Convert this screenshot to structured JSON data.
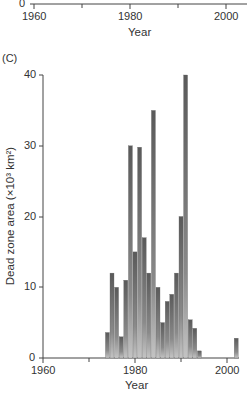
{
  "chart_data": [
    {
      "panel": "top (partial, cropped)",
      "type": "bar",
      "title": "",
      "xlabel": "Year",
      "ylabel": "",
      "x_ticks": [
        1960,
        1980,
        2000
      ],
      "y_ticks_visible": [
        0
      ],
      "xlim": [
        1960,
        2002
      ],
      "grid": false
    },
    {
      "panel": "(C)",
      "type": "bar",
      "title": "",
      "xlabel": "Year",
      "ylabel": "Dead zone area (×10³ km²)",
      "xlim": [
        1960,
        2003
      ],
      "ylim": [
        0,
        40
      ],
      "x_ticks": [
        1960,
        1980,
        2000
      ],
      "y_ticks": [
        0,
        10,
        20,
        30,
        40
      ],
      "grid": false,
      "legend": null,
      "categories": [
        1974,
        1975,
        1976,
        1977,
        1978,
        1979,
        1980,
        1981,
        1982,
        1983,
        1984,
        1985,
        1986,
        1987,
        1988,
        1989,
        1990,
        1991,
        1992,
        1993,
        1994,
        2002
      ],
      "values": [
        3.6,
        12,
        10,
        3,
        11,
        30,
        15,
        29.8,
        17,
        12,
        35,
        10,
        5,
        8,
        9,
        12,
        20,
        40,
        5.4,
        4.2,
        1,
        2.8
      ]
    }
  ],
  "top_panel": {
    "y_zero_label": "0",
    "x_labels": [
      "1960",
      "1980",
      "2000"
    ],
    "x_title": "Year"
  },
  "panel_c": {
    "panel_label": "(C)",
    "y_labels": [
      "40",
      "30",
      "20",
      "10",
      "0"
    ],
    "x_labels": [
      "1960",
      "1980",
      "2000"
    ],
    "x_title": "Year",
    "y_title": "Dead zone area (×10³ km²)"
  },
  "colors": {
    "axis": "#444444",
    "bar_dark": "#555555",
    "bar_light": "#bdbdbd"
  }
}
